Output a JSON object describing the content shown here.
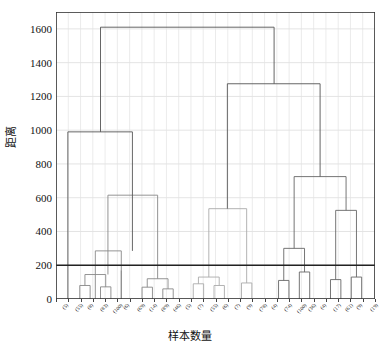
{
  "chart_data": {
    "type": "line",
    "subtype": "dendrogram",
    "title": "",
    "xlabel": "样本数量",
    "ylabel": "距离",
    "ylim": [
      0,
      1700
    ],
    "yticks": [
      0,
      200,
      400,
      600,
      800,
      1000,
      1200,
      1400,
      1600
    ],
    "grid": true,
    "legend": "none",
    "color_threshold": 200,
    "colors": {
      "above_threshold": "#555555",
      "cluster_1": "#888888",
      "cluster_2": "#aaaaaa",
      "cluster_3": "#666666",
      "cut_line": "#222222"
    },
    "leaf_labels": [
      "(5)",
      "(55)",
      "(8)",
      "(83)",
      "(100)",
      "(6)",
      "(69)",
      "(14)",
      "(89)",
      "(46)",
      "(5)",
      "(7)",
      "(55)",
      "(6)",
      "(7)",
      "(9)",
      "(78)",
      "(4)",
      "(74)",
      "(100)",
      "(36)",
      "(4)",
      "(17)",
      "(61)",
      "(9)",
      "(19)",
      "(40)"
    ],
    "leaf_count": 27,
    "merges": [
      {
        "id": "m1",
        "x1": 62,
        "x2": 76,
        "y": 80,
        "color": "#888888"
      },
      {
        "id": "m2",
        "x1": 90,
        "x2": 104,
        "y": 72,
        "color": "#888888"
      },
      {
        "id": "m3",
        "x1": 69,
        "x2": 97,
        "y": 145,
        "color": "#888888"
      },
      {
        "id": "m4",
        "x1": 118,
        "x2": 118,
        "y": 170,
        "color": "#888888"
      },
      {
        "id": "m5",
        "x1": 83,
        "x2": 118,
        "y": 285,
        "color": "#888888"
      },
      {
        "id": "m6",
        "x1": 146,
        "x2": 160,
        "y": 70,
        "color": "#888888"
      },
      {
        "id": "m7",
        "x1": 174,
        "x2": 188,
        "y": 60,
        "color": "#888888"
      },
      {
        "id": "m8",
        "x1": 153,
        "x2": 181,
        "y": 120,
        "color": "#888888"
      },
      {
        "id": "m9",
        "x1": 100,
        "x2": 167,
        "y": 615,
        "color": "#888888"
      },
      {
        "id": "m10",
        "x1": 46,
        "x2": 133,
        "y": 990,
        "color": "#555555"
      },
      {
        "id": "m11",
        "x1": 215,
        "x2": 229,
        "y": 90,
        "color": "#aaaaaa"
      },
      {
        "id": "m12",
        "x1": 243,
        "x2": 257,
        "y": 80,
        "color": "#aaaaaa"
      },
      {
        "id": "m13",
        "x1": 222,
        "x2": 250,
        "y": 130,
        "color": "#aaaaaa"
      },
      {
        "id": "m14",
        "x1": 280,
        "x2": 294,
        "y": 95,
        "color": "#aaaaaa"
      },
      {
        "id": "m15",
        "x1": 236,
        "x2": 287,
        "y": 535,
        "color": "#aaaaaa"
      },
      {
        "id": "m16",
        "x1": 330,
        "x2": 344,
        "y": 110,
        "color": "#666666"
      },
      {
        "id": "m17",
        "x1": 358,
        "x2": 372,
        "y": 160,
        "color": "#666666"
      },
      {
        "id": "m18",
        "x1": 337,
        "x2": 365,
        "y": 300,
        "color": "#666666"
      },
      {
        "id": "m19",
        "x1": 400,
        "x2": 414,
        "y": 115,
        "color": "#666666"
      },
      {
        "id": "m20",
        "x1": 428,
        "x2": 442,
        "y": 130,
        "color": "#666666"
      },
      {
        "id": "m21",
        "x1": 407,
        "x2": 435,
        "y": 525,
        "color": "#666666"
      },
      {
        "id": "m22",
        "x1": 351,
        "x2": 421,
        "y": 725,
        "color": "#666666"
      },
      {
        "id": "m23",
        "x1": 261,
        "x2": 386,
        "y": 1275,
        "color": "#555555"
      },
      {
        "id": "m24",
        "x1": 90,
        "x2": 324,
        "y": 1610,
        "color": "#555555"
      }
    ]
  }
}
